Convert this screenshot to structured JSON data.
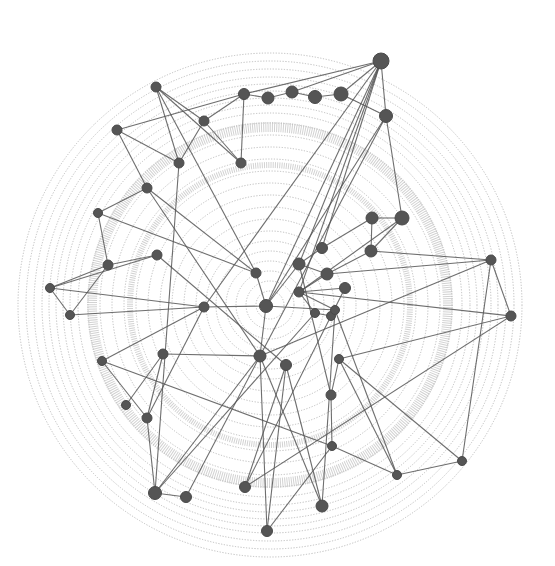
{
  "diagram": {
    "type": "network-graph",
    "style": {
      "node_color": "#555555",
      "edge_color": "#555555",
      "ring_color": "#bdbdbd",
      "background": "#ffffff"
    },
    "center": [
      270,
      305
    ],
    "rings": [
      14,
      24,
      34,
      44,
      54,
      64,
      74,
      86,
      98,
      110,
      122,
      134,
      146,
      158,
      170,
      182,
      192,
      200,
      207,
      214,
      221,
      228,
      236,
      244,
      252
    ],
    "bands": [
      {
        "r": 178,
        "width": 10
      },
      {
        "r": 140,
        "width": 6
      }
    ],
    "nodes": [
      {
        "id": 1,
        "x": 381,
        "y": 61,
        "r": 8
      },
      {
        "id": 2,
        "x": 156,
        "y": 87,
        "r": 5
      },
      {
        "id": 3,
        "x": 117,
        "y": 130,
        "r": 5
      },
      {
        "id": 4,
        "x": 244,
        "y": 94,
        "r": 5.5
      },
      {
        "id": 5,
        "x": 268,
        "y": 98,
        "r": 6
      },
      {
        "id": 6,
        "x": 292,
        "y": 92,
        "r": 6
      },
      {
        "id": 7,
        "x": 315,
        "y": 97,
        "r": 6.5
      },
      {
        "id": 8,
        "x": 341,
        "y": 94,
        "r": 7
      },
      {
        "id": 9,
        "x": 386,
        "y": 116,
        "r": 6.5
      },
      {
        "id": 10,
        "x": 204,
        "y": 121,
        "r": 5
      },
      {
        "id": 11,
        "x": 179,
        "y": 163,
        "r": 5
      },
      {
        "id": 12,
        "x": 241,
        "y": 163,
        "r": 5
      },
      {
        "id": 13,
        "x": 147,
        "y": 188,
        "r": 5
      },
      {
        "id": 14,
        "x": 98,
        "y": 213,
        "r": 4.5
      },
      {
        "id": 15,
        "x": 157,
        "y": 255,
        "r": 5
      },
      {
        "id": 16,
        "x": 108,
        "y": 265,
        "r": 5
      },
      {
        "id": 17,
        "x": 50,
        "y": 288,
        "r": 4.5
      },
      {
        "id": 18,
        "x": 70,
        "y": 315,
        "r": 4.5
      },
      {
        "id": 19,
        "x": 204,
        "y": 307,
        "r": 5
      },
      {
        "id": 20,
        "x": 256,
        "y": 273,
        "r": 5
      },
      {
        "id": 21,
        "x": 266,
        "y": 306,
        "r": 6.5
      },
      {
        "id": 22,
        "x": 372,
        "y": 218,
        "r": 6
      },
      {
        "id": 23,
        "x": 402,
        "y": 218,
        "r": 7
      },
      {
        "id": 24,
        "x": 322,
        "y": 248,
        "r": 5.5
      },
      {
        "id": 25,
        "x": 371,
        "y": 251,
        "r": 6
      },
      {
        "id": 26,
        "x": 299,
        "y": 264,
        "r": 6
      },
      {
        "id": 27,
        "x": 327,
        "y": 274,
        "r": 6
      },
      {
        "id": 28,
        "x": 345,
        "y": 288,
        "r": 5.5
      },
      {
        "id": 29,
        "x": 299,
        "y": 292,
        "r": 5
      },
      {
        "id": 30,
        "x": 315,
        "y": 313,
        "r": 4.5
      },
      {
        "id": 31,
        "x": 331,
        "y": 316,
        "r": 4.5
      },
      {
        "id": 32,
        "x": 335,
        "y": 310,
        "r": 4.5
      },
      {
        "id": 33,
        "x": 491,
        "y": 260,
        "r": 5
      },
      {
        "id": 34,
        "x": 511,
        "y": 316,
        "r": 5
      },
      {
        "id": 35,
        "x": 163,
        "y": 354,
        "r": 5
      },
      {
        "id": 36,
        "x": 102,
        "y": 361,
        "r": 4.5
      },
      {
        "id": 37,
        "x": 260,
        "y": 356,
        "r": 6
      },
      {
        "id": 38,
        "x": 286,
        "y": 365,
        "r": 5.5
      },
      {
        "id": 39,
        "x": 339,
        "y": 359,
        "r": 4.5
      },
      {
        "id": 40,
        "x": 126,
        "y": 405,
        "r": 4.5
      },
      {
        "id": 41,
        "x": 147,
        "y": 418,
        "r": 5
      },
      {
        "id": 42,
        "x": 331,
        "y": 395,
        "r": 5
      },
      {
        "id": 43,
        "x": 332,
        "y": 446,
        "r": 4.5
      },
      {
        "id": 44,
        "x": 155,
        "y": 493,
        "r": 6.5
      },
      {
        "id": 45,
        "x": 186,
        "y": 497,
        "r": 5.5
      },
      {
        "id": 46,
        "x": 245,
        "y": 487,
        "r": 5.5
      },
      {
        "id": 47,
        "x": 267,
        "y": 531,
        "r": 5.5
      },
      {
        "id": 48,
        "x": 322,
        "y": 506,
        "r": 6
      },
      {
        "id": 49,
        "x": 397,
        "y": 475,
        "r": 4.5
      },
      {
        "id": 50,
        "x": 462,
        "y": 461,
        "r": 4.5
      }
    ],
    "edges": [
      [
        1,
        4
      ],
      [
        1,
        6
      ],
      [
        1,
        8
      ],
      [
        1,
        9
      ],
      [
        1,
        26
      ],
      [
        1,
        24
      ],
      [
        1,
        29
      ],
      [
        1,
        21
      ],
      [
        1,
        19
      ],
      [
        2,
        10
      ],
      [
        2,
        11
      ],
      [
        2,
        12
      ],
      [
        2,
        20
      ],
      [
        3,
        4
      ],
      [
        3,
        11
      ],
      [
        3,
        13
      ],
      [
        4,
        5
      ],
      [
        4,
        10
      ],
      [
        4,
        12
      ],
      [
        5,
        6
      ],
      [
        6,
        7
      ],
      [
        7,
        8
      ],
      [
        8,
        9
      ],
      [
        9,
        23
      ],
      [
        9,
        21
      ],
      [
        9,
        37
      ],
      [
        10,
        12
      ],
      [
        10,
        11
      ],
      [
        11,
        44
      ],
      [
        13,
        14
      ],
      [
        13,
        20
      ],
      [
        13,
        37
      ],
      [
        14,
        16
      ],
      [
        14,
        20
      ],
      [
        15,
        16
      ],
      [
        15,
        17
      ],
      [
        15,
        38
      ],
      [
        16,
        17
      ],
      [
        16,
        18
      ],
      [
        17,
        18
      ],
      [
        17,
        19
      ],
      [
        18,
        19
      ],
      [
        19,
        21
      ],
      [
        19,
        36
      ],
      [
        19,
        41
      ],
      [
        20,
        21
      ],
      [
        21,
        26
      ],
      [
        21,
        37
      ],
      [
        21,
        32
      ],
      [
        22,
        23
      ],
      [
        22,
        24
      ],
      [
        22,
        25
      ],
      [
        23,
        25
      ],
      [
        23,
        29
      ],
      [
        24,
        26
      ],
      [
        25,
        27
      ],
      [
        25,
        33
      ],
      [
        26,
        27
      ],
      [
        26,
        42
      ],
      [
        27,
        29
      ],
      [
        27,
        33
      ],
      [
        28,
        29
      ],
      [
        28,
        31
      ],
      [
        29,
        30
      ],
      [
        29,
        32
      ],
      [
        29,
        34
      ],
      [
        30,
        31
      ],
      [
        30,
        44
      ],
      [
        31,
        32
      ],
      [
        31,
        46
      ],
      [
        32,
        48
      ],
      [
        32,
        49
      ],
      [
        33,
        34
      ],
      [
        33,
        37
      ],
      [
        33,
        50
      ],
      [
        34,
        39
      ],
      [
        34,
        46
      ],
      [
        35,
        37
      ],
      [
        35,
        40
      ],
      [
        35,
        41
      ],
      [
        36,
        41
      ],
      [
        36,
        43
      ],
      [
        37,
        44
      ],
      [
        37,
        45
      ],
      [
        37,
        47
      ],
      [
        37,
        48
      ],
      [
        38,
        46
      ],
      [
        38,
        47
      ],
      [
        38,
        48
      ],
      [
        39,
        42
      ],
      [
        39,
        49
      ],
      [
        39,
        50
      ],
      [
        42,
        43
      ],
      [
        43,
        47
      ],
      [
        43,
        49
      ],
      [
        44,
        45
      ],
      [
        44,
        41
      ],
      [
        49,
        50
      ]
    ]
  }
}
